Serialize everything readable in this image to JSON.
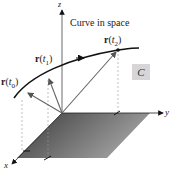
{
  "diagram": {
    "title": "Curve in space",
    "curve_label": "C",
    "axes": {
      "x": "x",
      "y": "y",
      "z": "z"
    },
    "points": [
      {
        "vec": "r",
        "param": "t",
        "sub": "0"
      },
      {
        "vec": "r",
        "param": "t",
        "sub": "1"
      },
      {
        "vec": "r",
        "param": "t",
        "sub": "2"
      }
    ],
    "colors": {
      "curve": "#111111",
      "vectors": "#666666",
      "plane_dark": "#3a3a3a",
      "plane_light": "#9a9a9a",
      "label_box": "#d6d6d6"
    }
  }
}
